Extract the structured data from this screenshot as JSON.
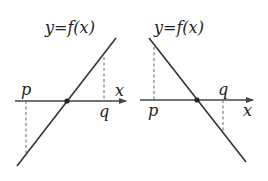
{
  "panels": [
    {
      "id": "left",
      "function_label": "y=f(x)",
      "axis_label": "x",
      "point_labels": {
        "p": "p",
        "q": "q"
      },
      "slope": "positive",
      "description": "Increasing line crossing x-axis between p and q; f(p)<0, f(q)>0"
    },
    {
      "id": "right",
      "function_label": "y=f(x)",
      "axis_label": "x",
      "point_labels": {
        "p": "p",
        "q": "q"
      },
      "slope": "negative",
      "description": "Decreasing line crossing x-axis between p and q; f(p)>0, f(q)<0"
    }
  ],
  "colors": {
    "line": "#333333",
    "axis": "#444444",
    "dashed": "#555555",
    "text": "#222222"
  }
}
